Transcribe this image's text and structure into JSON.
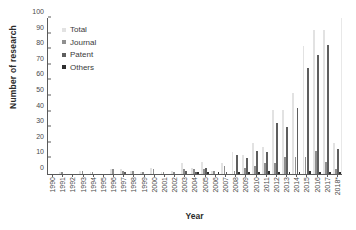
{
  "chart_data": {
    "type": "bar",
    "title": "",
    "xlabel": "Year",
    "ylabel": "Number of research",
    "ylim": [
      0,
      100
    ],
    "ytick_step": 10,
    "yticks": [
      0,
      10,
      20,
      30,
      40,
      50,
      60,
      70,
      80,
      90,
      100
    ],
    "grid": false,
    "legend_position": "upper-left-inside",
    "categories": [
      "1990",
      "1991",
      "1992",
      "1993",
      "1994",
      "1995",
      "1996",
      "1997",
      "1998",
      "1999",
      "2000",
      "2001",
      "2002",
      "2003",
      "2004",
      "2005",
      "2006",
      "2007",
      "2008",
      "2009",
      "2010",
      "2011",
      "2012",
      "2013",
      "2014",
      "2015",
      "2016",
      "2017",
      "2018*"
    ],
    "series": [
      {
        "name": "Total",
        "color": "#e2e2e2",
        "values": [
          0,
          1,
          0,
          2,
          1,
          0,
          3,
          3,
          2,
          1,
          4,
          1,
          2,
          7,
          4,
          8,
          2,
          7,
          14,
          12,
          20,
          17,
          41,
          41,
          52,
          82,
          92,
          92,
          20
        ]
      },
      {
        "name": "Journal",
        "color": "#8f8f8f",
        "values": [
          0,
          1,
          0,
          2,
          1,
          0,
          3,
          2,
          2,
          1,
          3,
          1,
          1,
          3,
          3,
          3,
          2,
          5,
          2,
          4,
          5,
          7,
          7,
          11,
          11,
          11,
          15,
          8,
          3
        ]
      },
      {
        "name": "Patent",
        "color": "#5e5e5e",
        "values": [
          0,
          0,
          0,
          0,
          0,
          0,
          0,
          1,
          0,
          0,
          0,
          0,
          0,
          2,
          1,
          4,
          0,
          1,
          12,
          10,
          15,
          14,
          33,
          30,
          42,
          68,
          76,
          83,
          16
        ]
      },
      {
        "name": "Others",
        "color": "#2f2f2f",
        "values": [
          0,
          0,
          0,
          0,
          0,
          0,
          0,
          0,
          0,
          0,
          0,
          0,
          0,
          0,
          1,
          1,
          1,
          0,
          1,
          1,
          1,
          2,
          1,
          1,
          1,
          2,
          1,
          1,
          1
        ]
      }
    ]
  },
  "legend": {
    "items": [
      {
        "label": "Total",
        "color": "#e2e2e2"
      },
      {
        "label": "Journal",
        "color": "#8f8f8f"
      },
      {
        "label": "Patent",
        "color": "#5e5e5e"
      },
      {
        "label": "Others",
        "color": "#2f2f2f"
      }
    ]
  }
}
